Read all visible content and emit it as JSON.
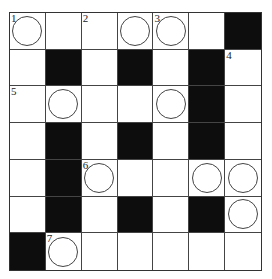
{
  "puzzle": {
    "type": "crossword",
    "rows": 7,
    "cols": 7,
    "colors": {
      "block": "#0d0d0d",
      "cell": "#ffffff",
      "line": "#444444"
    },
    "cells": [
      [
        {
          "black": false,
          "number": "1",
          "circle": true
        },
        {
          "black": false,
          "number": "",
          "circle": false
        },
        {
          "black": false,
          "number": "2",
          "circle": false
        },
        {
          "black": false,
          "number": "",
          "circle": true
        },
        {
          "black": false,
          "number": "3",
          "circle": true
        },
        {
          "black": false,
          "number": "",
          "circle": false
        },
        {
          "black": true,
          "number": "",
          "circle": false
        }
      ],
      [
        {
          "black": false,
          "number": "",
          "circle": false
        },
        {
          "black": true,
          "number": "",
          "circle": false
        },
        {
          "black": false,
          "number": "",
          "circle": false
        },
        {
          "black": true,
          "number": "",
          "circle": false
        },
        {
          "black": false,
          "number": "",
          "circle": false
        },
        {
          "black": true,
          "number": "",
          "circle": false
        },
        {
          "black": false,
          "number": "4",
          "circle": false
        }
      ],
      [
        {
          "black": false,
          "number": "5",
          "circle": false
        },
        {
          "black": false,
          "number": "",
          "circle": true
        },
        {
          "black": false,
          "number": "",
          "circle": false
        },
        {
          "black": false,
          "number": "",
          "circle": false
        },
        {
          "black": false,
          "number": "",
          "circle": true
        },
        {
          "black": true,
          "number": "",
          "circle": false
        },
        {
          "black": false,
          "number": "",
          "circle": false
        }
      ],
      [
        {
          "black": false,
          "number": "",
          "circle": false
        },
        {
          "black": true,
          "number": "",
          "circle": false
        },
        {
          "black": false,
          "number": "",
          "circle": false
        },
        {
          "black": true,
          "number": "",
          "circle": false
        },
        {
          "black": false,
          "number": "",
          "circle": false
        },
        {
          "black": true,
          "number": "",
          "circle": false
        },
        {
          "black": false,
          "number": "",
          "circle": false
        }
      ],
      [
        {
          "black": false,
          "number": "",
          "circle": false
        },
        {
          "black": true,
          "number": "",
          "circle": false
        },
        {
          "black": false,
          "number": "6",
          "circle": true
        },
        {
          "black": false,
          "number": "",
          "circle": false
        },
        {
          "black": false,
          "number": "",
          "circle": false
        },
        {
          "black": false,
          "number": "",
          "circle": true
        },
        {
          "black": false,
          "number": "",
          "circle": true
        }
      ],
      [
        {
          "black": false,
          "number": "",
          "circle": false
        },
        {
          "black": true,
          "number": "",
          "circle": false
        },
        {
          "black": false,
          "number": "",
          "circle": false
        },
        {
          "black": true,
          "number": "",
          "circle": false
        },
        {
          "black": false,
          "number": "",
          "circle": false
        },
        {
          "black": true,
          "number": "",
          "circle": false
        },
        {
          "black": false,
          "number": "",
          "circle": true
        }
      ],
      [
        {
          "black": true,
          "number": "",
          "circle": false
        },
        {
          "black": false,
          "number": "7",
          "circle": true
        },
        {
          "black": false,
          "number": "",
          "circle": false
        },
        {
          "black": false,
          "number": "",
          "circle": false
        },
        {
          "black": false,
          "number": "",
          "circle": false
        },
        {
          "black": false,
          "number": "",
          "circle": false
        },
        {
          "black": false,
          "number": "",
          "circle": false
        }
      ]
    ]
  }
}
